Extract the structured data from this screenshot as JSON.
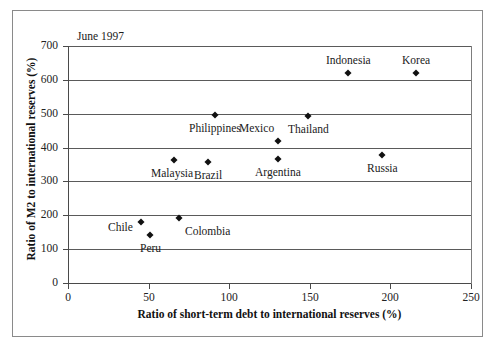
{
  "chart_data": {
    "type": "scatter",
    "title": "",
    "annotation": "June 1997",
    "xlabel": "Ratio of short-term debt to international reserves (%)",
    "ylabel": "Ratio of M2 to international reserves (%)",
    "xlim": [
      0,
      250
    ],
    "ylim": [
      0,
      700
    ],
    "xticks": [
      0,
      50,
      100,
      150,
      200,
      250
    ],
    "yticks": [
      0,
      100,
      200,
      300,
      400,
      500,
      600,
      700
    ],
    "grid": "horizontal",
    "legend": "none",
    "marker": "diamond",
    "marker_color": "#111111",
    "points": [
      {
        "label": "Chile",
        "x": 45,
        "y": 180,
        "label_pos": "left"
      },
      {
        "label": "Peru",
        "x": 51,
        "y": 142,
        "label_pos": "below"
      },
      {
        "label": "Malaysia",
        "x": 66,
        "y": 363,
        "label_pos": "below-left"
      },
      {
        "label": "Colombia",
        "x": 69,
        "y": 192,
        "label_pos": "below-right"
      },
      {
        "label": "Brazil",
        "x": 87,
        "y": 357,
        "label_pos": "below"
      },
      {
        "label": "Philippines",
        "x": 91,
        "y": 495,
        "label_pos": "below"
      },
      {
        "label": "Mexico",
        "x": 130,
        "y": 419,
        "label_pos": "above-left"
      },
      {
        "label": "Argentina",
        "x": 130,
        "y": 366,
        "label_pos": "below"
      },
      {
        "label": "Thailand",
        "x": 149,
        "y": 492,
        "label_pos": "below"
      },
      {
        "label": "Indonesia",
        "x": 174,
        "y": 619,
        "label_pos": "above"
      },
      {
        "label": "Russia",
        "x": 195,
        "y": 378,
        "label_pos": "below"
      },
      {
        "label": "Korea",
        "x": 216,
        "y": 619,
        "label_pos": "above"
      }
    ]
  },
  "axis": {
    "x_tick_labels": [
      "0",
      "50",
      "100",
      "150",
      "200",
      "250"
    ],
    "y_tick_labels": [
      "0",
      "100",
      "200",
      "300",
      "400",
      "500",
      "600",
      "700"
    ]
  }
}
